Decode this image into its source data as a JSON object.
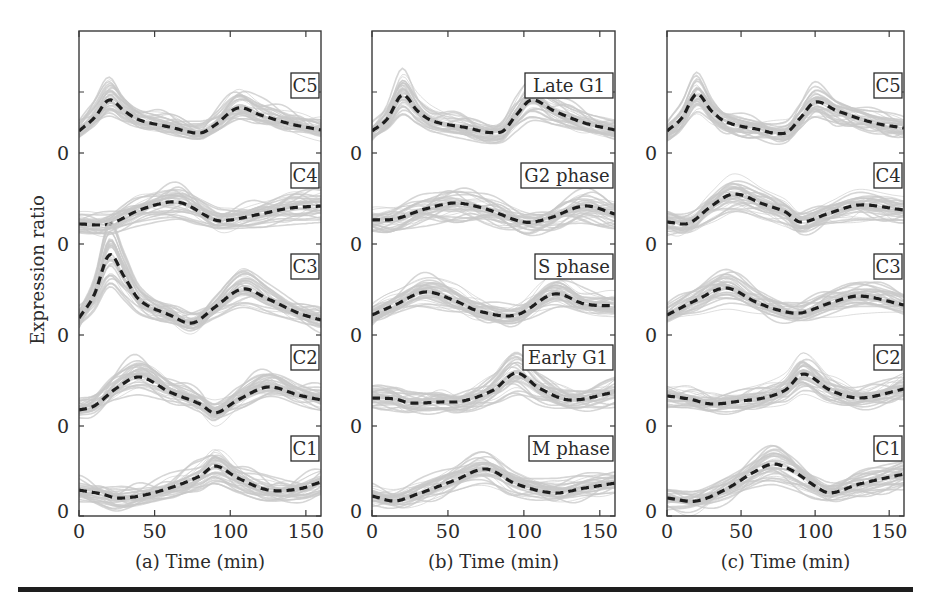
{
  "chart_data": [
    {
      "type": "line",
      "panel": "a",
      "xlabel": "(a) Time (min)",
      "ylabel": "Expression ratio",
      "xlim": [
        0,
        160
      ],
      "xticks": [
        0,
        50,
        100,
        150
      ],
      "yticks_label": "0",
      "grid": false,
      "stacked_offset_bands": true,
      "series": [
        {
          "name": "C5",
          "x": [
            0,
            10,
            20,
            30,
            40,
            60,
            80,
            90,
            105,
            120,
            140,
            160
          ],
          "values": [
            22,
            35,
            53,
            42,
            33,
            26,
            20,
            28,
            45,
            38,
            29,
            23
          ]
        },
        {
          "name": "C4",
          "x": [
            0,
            20,
            40,
            60,
            70,
            90,
            100,
            120,
            140,
            160
          ],
          "values": [
            20,
            20,
            34,
            42,
            40,
            24,
            24,
            30,
            36,
            38
          ]
        },
        {
          "name": "C3",
          "x": [
            0,
            10,
            20,
            30,
            40,
            60,
            75,
            90,
            108,
            125,
            145,
            160
          ],
          "values": [
            17,
            40,
            80,
            58,
            35,
            20,
            12,
            28,
            46,
            36,
            22,
            15
          ]
        },
        {
          "name": "C2",
          "x": [
            0,
            10,
            25,
            40,
            60,
            80,
            90,
            105,
            125,
            145,
            160
          ],
          "values": [
            16,
            20,
            38,
            49,
            34,
            22,
            13,
            26,
            39,
            31,
            26
          ]
        },
        {
          "name": "C1",
          "x": [
            0,
            15,
            25,
            40,
            60,
            80,
            90,
            105,
            125,
            145,
            160
          ],
          "values": [
            26,
            22,
            18,
            20,
            28,
            40,
            50,
            38,
            26,
            27,
            34
          ]
        }
      ]
    },
    {
      "type": "line",
      "panel": "b",
      "xlabel": "(b) Time (min)",
      "ylabel": "",
      "xlim": [
        0,
        160
      ],
      "xticks": [
        0,
        50,
        100,
        150
      ],
      "yticks_label": "0",
      "grid": false,
      "stacked_offset_bands": true,
      "series": [
        {
          "name": "Late G1",
          "x": [
            0,
            10,
            20,
            30,
            40,
            60,
            85,
            95,
            105,
            120,
            140,
            160
          ],
          "values": [
            22,
            34,
            58,
            42,
            32,
            26,
            21,
            38,
            53,
            42,
            30,
            23
          ]
        },
        {
          "name": "G2 phase",
          "x": [
            0,
            15,
            35,
            55,
            75,
            100,
            115,
            140,
            160
          ],
          "values": [
            24,
            25,
            35,
            41,
            35,
            22,
            25,
            38,
            30
          ]
        },
        {
          "name": "S phase",
          "x": [
            0,
            15,
            35,
            55,
            70,
            95,
            120,
            140,
            160
          ],
          "values": [
            20,
            30,
            43,
            34,
            24,
            20,
            41,
            31,
            29
          ]
        },
        {
          "name": "Early G1",
          "x": [
            0,
            15,
            25,
            45,
            60,
            80,
            95,
            110,
            130,
            160
          ],
          "values": [
            28,
            27,
            23,
            24,
            25,
            36,
            53,
            38,
            26,
            34
          ]
        },
        {
          "name": "M phase",
          "x": [
            0,
            15,
            30,
            55,
            75,
            95,
            120,
            140,
            160
          ],
          "values": [
            20,
            15,
            22,
            36,
            47,
            32,
            23,
            28,
            33
          ]
        }
      ]
    },
    {
      "type": "line",
      "panel": "c",
      "xlabel": "(c) Time (min)",
      "ylabel": "",
      "xlim": [
        0,
        160
      ],
      "xticks": [
        0,
        50,
        100,
        150
      ],
      "yticks_label": "0",
      "grid": false,
      "stacked_offset_bands": true,
      "series": [
        {
          "name": "C5",
          "x": [
            0,
            10,
            20,
            30,
            40,
            60,
            80,
            90,
            100,
            115,
            140,
            160
          ],
          "values": [
            22,
            35,
            59,
            42,
            31,
            24,
            20,
            35,
            51,
            42,
            30,
            25
          ]
        },
        {
          "name": "C4",
          "x": [
            0,
            15,
            30,
            45,
            65,
            80,
            90,
            110,
            130,
            160
          ],
          "values": [
            22,
            21,
            38,
            50,
            40,
            32,
            22,
            31,
            39,
            34
          ]
        },
        {
          "name": "C3",
          "x": [
            0,
            20,
            40,
            60,
            75,
            90,
            110,
            130,
            160
          ],
          "values": [
            20,
            35,
            47,
            33,
            25,
            22,
            32,
            39,
            30
          ]
        },
        {
          "name": "C2",
          "x": [
            0,
            15,
            30,
            50,
            65,
            80,
            92,
            110,
            130,
            160
          ],
          "values": [
            30,
            27,
            22,
            25,
            28,
            36,
            52,
            36,
            28,
            37
          ]
        },
        {
          "name": "C1",
          "x": [
            0,
            20,
            40,
            60,
            72,
            85,
            100,
            110,
            130,
            160
          ],
          "values": [
            18,
            15,
            27,
            45,
            52,
            45,
            30,
            23,
            32,
            42
          ]
        }
      ]
    }
  ],
  "figure": {
    "ylabel": "Expression ratio",
    "zero_label": "0",
    "colors": {
      "mean_curve": "#1e1e1e",
      "gene_traces": "#c8c8c8",
      "axes": "#3a3a3a"
    }
  }
}
